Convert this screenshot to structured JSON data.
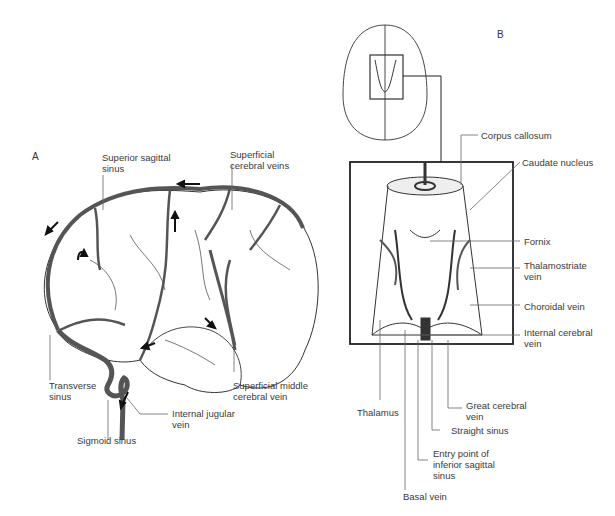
{
  "panels": {
    "a": {
      "letter": "A",
      "labels": {
        "superior_sagittal_sinus": "Superior sagittal\nsinus",
        "superficial_cerebral_veins": "Superficial\ncerebral veins",
        "transverse_sinus": "Transverse\nsinus",
        "sigmoid_sinus": "Sigmoid sinus",
        "internal_jugular_vein": "Internal jugular\nvein",
        "superficial_middle_cerebral_vein": "Superficial middle\ncerebral vein"
      }
    },
    "b": {
      "letter": "B",
      "labels": {
        "corpus_callosum": "Corpus callosum",
        "caudate_nucleus": "Caudate nucleus",
        "fornix": "Fornix",
        "thalamostriate_vein": "Thalamostriate\nvein",
        "choroidal_vein": "Choroidal vein",
        "internal_cerebral_vein": "Internal cerebral\nvein",
        "thalamus": "Thalamus",
        "great_cerebral_vein": "Great cerebral\nvein",
        "straight_sinus": "Straight sinus",
        "entry_point_inferior_sagittal_sinus": "Entry point of\ninferior sagittal\nsinus",
        "basal_vein": "Basal vein"
      }
    }
  },
  "colors": {
    "vein": "#555555",
    "outline": "#333333",
    "leader": "#666666"
  }
}
